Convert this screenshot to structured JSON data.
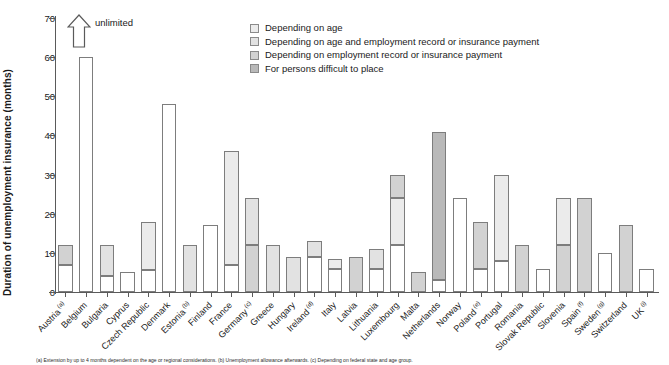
{
  "chart_data": {
    "type": "bar",
    "title": "",
    "ylabel": "Duration of unemployment insurance (months)",
    "xlabel": "",
    "ylim": [
      0,
      70
    ],
    "yticks": [
      0,
      10,
      20,
      30,
      40,
      50,
      60,
      70
    ],
    "grid": false,
    "stacked": true,
    "legend_position": "top-center",
    "annotations": [
      {
        "text": "unlimited",
        "target": "Belgium",
        "marker": "up-arrow"
      }
    ],
    "series": [
      {
        "name": "Depending on age",
        "color": "#ebebeb"
      },
      {
        "name": "Depending on age and employment record or insurance payment",
        "color": "#e2e2e2"
      },
      {
        "name": "Depending on employment record or insurance payment",
        "color": "#d2d2d2"
      },
      {
        "name": "For persons difficult to place",
        "color": "#b9b9b9"
      }
    ],
    "categories": [
      "Austria",
      "Belgium",
      "Bulgaria",
      "Cyprus",
      "Czech Republic",
      "Denmark",
      "Estonia",
      "Finland",
      "France",
      "Germany",
      "Greece",
      "Hungary",
      "Ireland",
      "Italy",
      "Latvia",
      "Lithuania",
      "Luxembourg",
      "Malta",
      "Netherlands",
      "Norway",
      "Poland",
      "Portugal",
      "Romania",
      "Slovak Republic",
      "Slovenia",
      "Spain",
      "Sweden",
      "Switzerland",
      "UK"
    ],
    "category_footnote_marks": {
      "Austria": "(a)",
      "Estonia": "(b)",
      "Germany": "(c)",
      "Ireland": "(d)",
      "Poland": "(e)",
      "Spain": "(f)",
      "Sweden": "(g)",
      "UK": "(i)"
    },
    "bars": [
      {
        "country": "Austria",
        "total": 12,
        "segments": [
          {
            "from": 0,
            "to": 7,
            "fill": "white"
          },
          {
            "from": 7,
            "to": 12,
            "fill": "emp"
          }
        ]
      },
      {
        "country": "Belgium",
        "total": 60,
        "segments": [
          {
            "from": 0,
            "to": 60,
            "fill": "white"
          }
        ]
      },
      {
        "country": "Bulgaria",
        "total": 12,
        "segments": [
          {
            "from": 0,
            "to": 4,
            "fill": "white"
          },
          {
            "from": 4,
            "to": 12,
            "fill": "age-emp"
          }
        ]
      },
      {
        "country": "Cyprus",
        "total": 5,
        "segments": [
          {
            "from": 0,
            "to": 5,
            "fill": "white"
          }
        ]
      },
      {
        "country": "Czech Republic",
        "total": 18,
        "segments": [
          {
            "from": 0,
            "to": 5.5,
            "fill": "white"
          },
          {
            "from": 5.5,
            "to": 18,
            "fill": "age"
          }
        ]
      },
      {
        "country": "Denmark",
        "total": 48,
        "segments": [
          {
            "from": 0,
            "to": 48,
            "fill": "white"
          }
        ]
      },
      {
        "country": "Estonia",
        "total": 12,
        "segments": [
          {
            "from": 0,
            "to": 12,
            "fill": "age-emp"
          }
        ]
      },
      {
        "country": "Finland",
        "total": 17,
        "segments": [
          {
            "from": 0,
            "to": 17,
            "fill": "white"
          }
        ]
      },
      {
        "country": "France",
        "total": 36,
        "segments": [
          {
            "from": 0,
            "to": 7,
            "fill": "white"
          },
          {
            "from": 7,
            "to": 36,
            "fill": "age"
          }
        ]
      },
      {
        "country": "Germany",
        "total": 24,
        "segments": [
          {
            "from": 0,
            "to": 12,
            "fill": "emp"
          },
          {
            "from": 12,
            "to": 24,
            "fill": "age-emp"
          }
        ]
      },
      {
        "country": "Greece",
        "total": 12,
        "segments": [
          {
            "from": 0,
            "to": 12,
            "fill": "age-emp"
          }
        ]
      },
      {
        "country": "Hungary",
        "total": 9,
        "segments": [
          {
            "from": 0,
            "to": 9,
            "fill": "age-emp"
          }
        ]
      },
      {
        "country": "Ireland",
        "total": 13,
        "segments": [
          {
            "from": 0,
            "to": 9,
            "fill": "white"
          },
          {
            "from": 9,
            "to": 13,
            "fill": "age-emp"
          }
        ]
      },
      {
        "country": "Italy",
        "total": 8.5,
        "segments": [
          {
            "from": 0,
            "to": 6,
            "fill": "white"
          },
          {
            "from": 6,
            "to": 8.5,
            "fill": "age"
          }
        ]
      },
      {
        "country": "Latvia",
        "total": 9,
        "segments": [
          {
            "from": 0,
            "to": 9,
            "fill": "emp"
          }
        ]
      },
      {
        "country": "Lithuania",
        "total": 11,
        "segments": [
          {
            "from": 0,
            "to": 6,
            "fill": "white"
          },
          {
            "from": 6,
            "to": 11,
            "fill": "age-emp"
          }
        ]
      },
      {
        "country": "Luxembourg",
        "total": 30,
        "segments": [
          {
            "from": 0,
            "to": 12,
            "fill": "white"
          },
          {
            "from": 12,
            "to": 24,
            "fill": "age"
          },
          {
            "from": 24,
            "to": 30,
            "fill": "emp"
          }
        ]
      },
      {
        "country": "Malta",
        "total": 5,
        "segments": [
          {
            "from": 0,
            "to": 5,
            "fill": "emp"
          }
        ]
      },
      {
        "country": "Netherlands",
        "total": 41,
        "segments": [
          {
            "from": 0,
            "to": 3,
            "fill": "white"
          },
          {
            "from": 3,
            "to": 41,
            "fill": "diff"
          }
        ]
      },
      {
        "country": "Norway",
        "total": 24,
        "segments": [
          {
            "from": 0,
            "to": 24,
            "fill": "white"
          }
        ]
      },
      {
        "country": "Poland",
        "total": 18,
        "segments": [
          {
            "from": 0,
            "to": 6,
            "fill": "white"
          },
          {
            "from": 6,
            "to": 18,
            "fill": "emp"
          }
        ]
      },
      {
        "country": "Portugal",
        "total": 30,
        "segments": [
          {
            "from": 0,
            "to": 8,
            "fill": "white"
          },
          {
            "from": 8,
            "to": 30,
            "fill": "age"
          }
        ]
      },
      {
        "country": "Romania",
        "total": 12,
        "segments": [
          {
            "from": 0,
            "to": 12,
            "fill": "emp"
          }
        ]
      },
      {
        "country": "Slovak Republic",
        "total": 6,
        "segments": [
          {
            "from": 0,
            "to": 6,
            "fill": "white"
          }
        ]
      },
      {
        "country": "Slovenia",
        "total": 24,
        "segments": [
          {
            "from": 0,
            "to": 12,
            "fill": "emp"
          },
          {
            "from": 12,
            "to": 24,
            "fill": "age"
          }
        ]
      },
      {
        "country": "Spain",
        "total": 24,
        "segments": [
          {
            "from": 0,
            "to": 24,
            "fill": "emp"
          }
        ]
      },
      {
        "country": "Sweden",
        "total": 10,
        "segments": [
          {
            "from": 0,
            "to": 10,
            "fill": "white"
          }
        ]
      },
      {
        "country": "Switzerland",
        "total": 17,
        "segments": [
          {
            "from": 0,
            "to": 17,
            "fill": "emp"
          }
        ]
      },
      {
        "country": "UK",
        "total": 6,
        "segments": [
          {
            "from": 0,
            "to": 6,
            "fill": "white"
          }
        ]
      }
    ]
  },
  "legend": {
    "items": [
      {
        "label": "Depending on age",
        "fill": "age"
      },
      {
        "label": "Depending on age and employment record or insurance payment",
        "fill": "age-emp"
      },
      {
        "label": "Depending on employment record or insurance payment",
        "fill": "emp"
      },
      {
        "label": "For persons difficult to place",
        "fill": "diff"
      }
    ]
  },
  "annotation": {
    "unlimited_label": "unlimited"
  },
  "axis": {
    "y_title": "Duration of unemployment insurance (months)"
  },
  "footnotes": {
    "text": "(a) Extension by up to 4 months dependent on the age or regional considerations.   (b) Unemployment allowance afterwards.   (c) Depending on federal state and age group."
  }
}
